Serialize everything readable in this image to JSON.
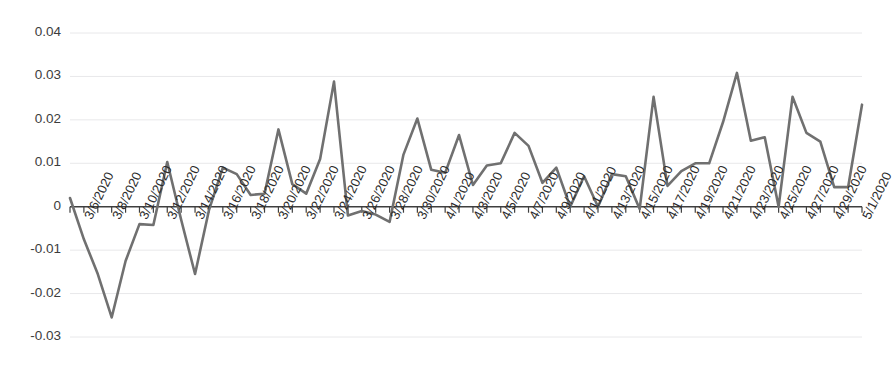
{
  "chart_data": {
    "type": "line",
    "title": "",
    "subtitle": "",
    "xlabel": "",
    "ylabel": "",
    "grid": true,
    "grid_axis": "y",
    "legend": false,
    "legend_position": "none",
    "line_color": "#707070",
    "axis_color": "#3f3f3f",
    "gridline_color": "#e8e8ea",
    "ylim": [
      -0.03,
      0.04
    ],
    "yticks": [
      0.04,
      0.03,
      0.02,
      0.01,
      0,
      -0.01,
      -0.02,
      -0.03
    ],
    "ytick_labels": [
      "0.04",
      "0.03",
      "0.02",
      "0.01",
      "0",
      "-0.01",
      "-0.02",
      "-0.03"
    ],
    "x_tick_label_rotation_deg": -64,
    "x_label_interval_days": 2,
    "xtick_labels": [
      "3/6/2020",
      "3/8/2020",
      "3/10/2020",
      "3/12/2020",
      "3/14/2020",
      "3/16/2020",
      "3/18/2020",
      "3/20/2020",
      "3/22/2020",
      "3/24/2020",
      "3/26/2020",
      "3/28/2020",
      "3/30/2020",
      "4/1/2020",
      "4/3/2020",
      "4/5/2020",
      "4/7/2020",
      "4/9/2020",
      "4/11/2020",
      "4/13/2020",
      "4/15/2020",
      "4/17/2020",
      "4/19/2020",
      "4/21/2020",
      "4/23/2020",
      "4/25/2020",
      "4/27/2020",
      "4/29/2020",
      "5/1/2020"
    ],
    "x": [
      "3/5/2020",
      "3/6/2020",
      "3/7/2020",
      "3/8/2020",
      "3/9/2020",
      "3/10/2020",
      "3/11/2020",
      "3/12/2020",
      "3/13/2020",
      "3/14/2020",
      "3/15/2020",
      "3/16/2020",
      "3/17/2020",
      "3/18/2020",
      "3/19/2020",
      "3/20/2020",
      "3/21/2020",
      "3/22/2020",
      "3/23/2020",
      "3/24/2020",
      "3/25/2020",
      "3/26/2020",
      "3/27/2020",
      "3/28/2020",
      "3/29/2020",
      "3/30/2020",
      "3/31/2020",
      "4/1/2020",
      "4/2/2020",
      "4/3/2020",
      "4/4/2020",
      "4/5/2020",
      "4/6/2020",
      "4/7/2020",
      "4/8/2020",
      "4/9/2020",
      "4/10/2020",
      "4/11/2020",
      "4/12/2020",
      "4/13/2020",
      "4/14/2020",
      "4/15/2020",
      "4/16/2020",
      "4/17/2020",
      "4/18/2020",
      "4/19/2020",
      "4/20/2020",
      "4/21/2020",
      "4/22/2020",
      "4/23/2020",
      "4/24/2020",
      "4/25/2020",
      "4/26/2020",
      "4/27/2020",
      "4/28/2020",
      "4/29/2020",
      "4/30/2020",
      "5/1/2020"
    ],
    "series": [
      {
        "name": "series-1",
        "color": "#707070",
        "values": [
          0.002,
          -0.0075,
          -0.0155,
          -0.0255,
          -0.0125,
          -0.004,
          -0.0042,
          0.0103,
          -0.003,
          -0.0155,
          -0.0008,
          0.009,
          0.0075,
          0.0027,
          0.003,
          0.0178,
          0.0052,
          0.003,
          0.011,
          0.0288,
          -0.002,
          -0.001,
          -0.0018,
          -0.0035,
          0.012,
          0.0203,
          0.0085,
          0.0078,
          0.0165,
          0.005,
          0.0095,
          0.01,
          0.017,
          0.014,
          0.0055,
          0.009,
          0.0,
          0.007,
          0.0,
          0.0075,
          0.007,
          -0.0005,
          0.0253,
          0.0048,
          0.0082,
          0.01,
          0.01,
          0.0195,
          0.0308,
          0.0152,
          0.016,
          0.0,
          0.0253,
          0.017,
          0.015,
          0.0045,
          0.0045,
          0.0235
        ]
      }
    ]
  },
  "axes": {
    "zero_line_label": "0"
  }
}
